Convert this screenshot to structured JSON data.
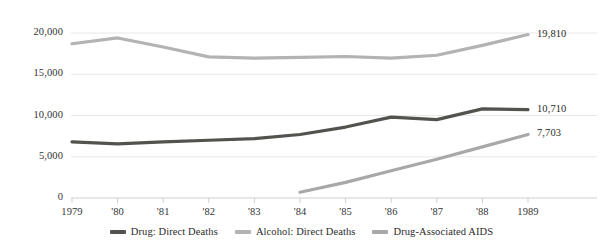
{
  "chart_data": {
    "type": "line",
    "title": "",
    "subtitle": "",
    "xlabel": "",
    "ylabel": "",
    "x": [
      1979,
      1980,
      1981,
      1982,
      1983,
      1984,
      1985,
      1986,
      1987,
      1988,
      1989
    ],
    "xtick_labels": [
      "1979",
      "'80",
      "'81",
      "'82",
      "'83",
      "'84",
      "'85",
      "'86",
      "'87",
      "'88",
      "1989"
    ],
    "ytick_labels": [
      "0",
      "5,000",
      "10,000",
      "15,000",
      "20,000"
    ],
    "ytick_values": [
      0,
      5000,
      10000,
      15000,
      20000
    ],
    "ylim": [
      0,
      20000
    ],
    "grid": true,
    "legend_position": "bottom",
    "series": [
      {
        "name": "Drug: Direct Deaths",
        "color": "#54524f",
        "values": [
          6800,
          6560,
          6800,
          7000,
          7200,
          7700,
          8600,
          9800,
          9500,
          10800,
          10710
        ],
        "end_label": "10,710"
      },
      {
        "name": "Alcohol: Direct Deaths",
        "color": "#b3b3b3",
        "values": [
          18700,
          19400,
          18300,
          17100,
          16950,
          17050,
          17150,
          16950,
          17300,
          18500,
          19810
        ],
        "end_label": "19,810"
      },
      {
        "name": "Drug-Associated AIDS",
        "color": "#a8a8a8",
        "values": [
          null,
          null,
          null,
          null,
          null,
          700,
          1900,
          3300,
          4700,
          6200,
          7703
        ],
        "end_label": "7,703"
      }
    ],
    "end_labels": [
      {
        "text": "19,810",
        "value": 19810
      },
      {
        "text": "10,710",
        "value": 10710
      },
      {
        "text": "7,703",
        "value": 7703
      }
    ]
  },
  "legend": {
    "items": [
      {
        "label": "Drug: Direct Deaths",
        "color": "#54524f"
      },
      {
        "label": "Alcohol: Direct Deaths",
        "color": "#b3b3b3"
      },
      {
        "label": "Drug-Associated AIDS",
        "color": "#a8a8a8"
      }
    ]
  },
  "colors": {
    "grid": "#e8e8e8",
    "axis": "#cfcfcf",
    "text": "#2b2b2b",
    "background": "#ffffff"
  }
}
